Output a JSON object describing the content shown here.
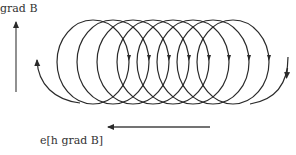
{
  "diagram": {
    "labels": {
      "gradient": "grad B",
      "drift": "e[h grad B]"
    },
    "colors": {
      "stroke": "#2a2a2a",
      "background": "#ffffff"
    },
    "loops": {
      "count": 8,
      "first_center_x": 93,
      "center_y": 62,
      "step_x": 20,
      "rx": 36,
      "ry": 42
    },
    "arrows": {
      "gradient_arrow": {
        "x": 16,
        "y_from": 92,
        "y_to": 20,
        "direction": "up"
      },
      "drift_arrow": {
        "y": 127,
        "x_from": 210,
        "x_to": 106,
        "direction": "left"
      }
    }
  }
}
